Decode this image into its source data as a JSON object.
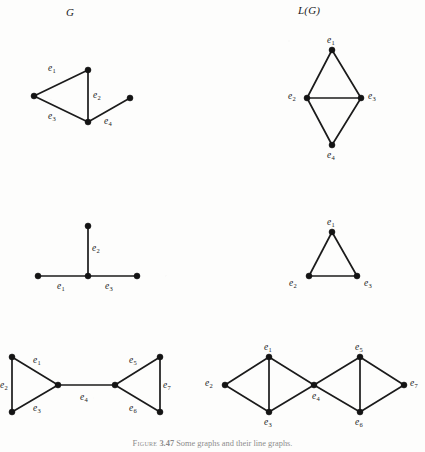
{
  "figure": {
    "caption_label": "Figure",
    "caption_number": "3.47",
    "caption_text": "Some graphs and their line graphs.",
    "columns": {
      "left_header": "G",
      "right_header": "L(G)"
    },
    "background_color": "#fdfdfc",
    "ink_color": "#1b1b1b"
  },
  "graphs": [
    {
      "id": "row1-left",
      "name": "graph-g-row1",
      "column": "G",
      "description": "Triangle with a pendant path; four labelled edges.",
      "nodes": [
        {
          "id": "a",
          "x": 88,
          "y": 70
        },
        {
          "id": "b",
          "x": 34,
          "y": 96
        },
        {
          "id": "c",
          "x": 88,
          "y": 122
        },
        {
          "id": "d",
          "x": 130,
          "y": 98
        }
      ],
      "edges": [
        {
          "from": "a",
          "to": "b",
          "label": "e",
          "sub": "1"
        },
        {
          "from": "a",
          "to": "c",
          "label": "e",
          "sub": "2"
        },
        {
          "from": "b",
          "to": "c",
          "label": "e",
          "sub": "3"
        },
        {
          "from": "c",
          "to": "d",
          "label": "e",
          "sub": "4"
        }
      ],
      "edge_labels": [
        {
          "label": "e",
          "sub": "1",
          "x": 48,
          "y": 64
        },
        {
          "label": "e",
          "sub": "2",
          "x": 93,
          "y": 91
        },
        {
          "label": "e",
          "sub": "3",
          "x": 48,
          "y": 112
        },
        {
          "label": "e",
          "sub": "4",
          "x": 104,
          "y": 117
        }
      ]
    },
    {
      "id": "row1-right",
      "name": "line-graph-lg-row1",
      "column": "L(G)",
      "description": "Diamond K4 minus an edge; vertices named for edges of G.",
      "nodes": [
        {
          "id": "e1",
          "x": 332,
          "y": 50
        },
        {
          "id": "e2",
          "x": 307,
          "y": 98
        },
        {
          "id": "e3",
          "x": 361,
          "y": 98
        },
        {
          "id": "e4",
          "x": 332,
          "y": 145
        }
      ],
      "edges": [
        {
          "from": "e1",
          "to": "e2"
        },
        {
          "from": "e1",
          "to": "e3"
        },
        {
          "from": "e2",
          "to": "e3"
        },
        {
          "from": "e2",
          "to": "e4"
        },
        {
          "from": "e3",
          "to": "e4"
        }
      ],
      "vertex_labels": [
        {
          "label": "e",
          "sub": "1",
          "x": 327,
          "y": 36
        },
        {
          "label": "e",
          "sub": "2",
          "x": 288,
          "y": 92
        },
        {
          "label": "e",
          "sub": "3",
          "x": 368,
          "y": 92
        },
        {
          "label": "e",
          "sub": "4",
          "x": 327,
          "y": 151
        }
      ]
    },
    {
      "id": "row2-left",
      "name": "graph-g-row2",
      "column": "G",
      "description": "Star K1,3 drawn as a T shape; three labelled edges.",
      "nodes": [
        {
          "id": "top",
          "x": 88,
          "y": 226
        },
        {
          "id": "center",
          "x": 88,
          "y": 276
        },
        {
          "id": "left",
          "x": 38,
          "y": 276
        },
        {
          "id": "right",
          "x": 137,
          "y": 276
        }
      ],
      "edges": [
        {
          "from": "center",
          "to": "left",
          "label": "e",
          "sub": "1"
        },
        {
          "from": "center",
          "to": "top",
          "label": "e",
          "sub": "2"
        },
        {
          "from": "center",
          "to": "right",
          "label": "e",
          "sub": "3"
        }
      ],
      "edge_labels": [
        {
          "label": "e",
          "sub": "1",
          "x": 57,
          "y": 282
        },
        {
          "label": "e",
          "sub": "2",
          "x": 92,
          "y": 244
        },
        {
          "label": "e",
          "sub": "3",
          "x": 105,
          "y": 282
        }
      ]
    },
    {
      "id": "row2-right",
      "name": "line-graph-lg-row2",
      "column": "L(G)",
      "description": "Triangle K3; vertices named for the three edges of the star.",
      "nodes": [
        {
          "id": "e1",
          "x": 332,
          "y": 232
        },
        {
          "id": "e2",
          "x": 309,
          "y": 276
        },
        {
          "id": "e3",
          "x": 357,
          "y": 276
        }
      ],
      "edges": [
        {
          "from": "e1",
          "to": "e2"
        },
        {
          "from": "e1",
          "to": "e3"
        },
        {
          "from": "e2",
          "to": "e3"
        }
      ],
      "vertex_labels": [
        {
          "label": "e",
          "sub": "1",
          "x": 327,
          "y": 218
        },
        {
          "label": "e",
          "sub": "2",
          "x": 289,
          "y": 279
        },
        {
          "label": "e",
          "sub": "3",
          "x": 364,
          "y": 279
        }
      ]
    },
    {
      "id": "row3-left",
      "name": "graph-g-row3",
      "column": "G",
      "description": "Bowtie: two triangles joined by a bridge; seven labelled edges.",
      "nodes": [
        {
          "id": "lt",
          "x": 12,
          "y": 357
        },
        {
          "id": "lb",
          "x": 12,
          "y": 412
        },
        {
          "id": "lc",
          "x": 58,
          "y": 385
        },
        {
          "id": "rc",
          "x": 115,
          "y": 385
        },
        {
          "id": "rt",
          "x": 160,
          "y": 357
        },
        {
          "id": "rb",
          "x": 160,
          "y": 412
        }
      ],
      "edges": [
        {
          "from": "lt",
          "to": "lc",
          "label": "e",
          "sub": "1"
        },
        {
          "from": "lt",
          "to": "lb",
          "label": "e",
          "sub": "2"
        },
        {
          "from": "lb",
          "to": "lc",
          "label": "e",
          "sub": "3"
        },
        {
          "from": "lc",
          "to": "rc",
          "label": "e",
          "sub": "4"
        },
        {
          "from": "rc",
          "to": "rt",
          "label": "e",
          "sub": "5"
        },
        {
          "from": "rc",
          "to": "rb",
          "label": "e",
          "sub": "6"
        },
        {
          "from": "rt",
          "to": "rb",
          "label": "e",
          "sub": "7"
        }
      ],
      "edge_labels": [
        {
          "label": "e",
          "sub": "1",
          "x": 33,
          "y": 356
        },
        {
          "label": "e",
          "sub": "2",
          "x": 0,
          "y": 381
        },
        {
          "label": "e",
          "sub": "3",
          "x": 33,
          "y": 404
        },
        {
          "label": "e",
          "sub": "4",
          "x": 80,
          "y": 393
        },
        {
          "label": "e",
          "sub": "5",
          "x": 129,
          "y": 356
        },
        {
          "label": "e",
          "sub": "6",
          "x": 129,
          "y": 404
        },
        {
          "label": "e",
          "sub": "7",
          "x": 163,
          "y": 381
        }
      ]
    },
    {
      "id": "row3-right",
      "name": "line-graph-lg-row3",
      "column": "L(G)",
      "description": "Line graph of the bowtie: two K4-minus-edge diamonds sharing vertex e4, plus e7.",
      "nodes": [
        {
          "id": "e2",
          "x": 225,
          "y": 385
        },
        {
          "id": "e1",
          "x": 269,
          "y": 357
        },
        {
          "id": "e3",
          "x": 269,
          "y": 412
        },
        {
          "id": "e4",
          "x": 314,
          "y": 385
        },
        {
          "id": "e5",
          "x": 360,
          "y": 357
        },
        {
          "id": "e6",
          "x": 360,
          "y": 412
        },
        {
          "id": "e7",
          "x": 404,
          "y": 385
        }
      ],
      "edges": [
        {
          "from": "e2",
          "to": "e1"
        },
        {
          "from": "e2",
          "to": "e3"
        },
        {
          "from": "e1",
          "to": "e3"
        },
        {
          "from": "e1",
          "to": "e4"
        },
        {
          "from": "e3",
          "to": "e4"
        },
        {
          "from": "e4",
          "to": "e5"
        },
        {
          "from": "e4",
          "to": "e6"
        },
        {
          "from": "e5",
          "to": "e6"
        },
        {
          "from": "e5",
          "to": "e7"
        },
        {
          "from": "e6",
          "to": "e7"
        }
      ],
      "vertex_labels": [
        {
          "label": "e",
          "sub": "2",
          "x": 205,
          "y": 379
        },
        {
          "label": "e",
          "sub": "1",
          "x": 264,
          "y": 343
        },
        {
          "label": "e",
          "sub": "3",
          "x": 264,
          "y": 418
        },
        {
          "label": "e",
          "sub": "4",
          "x": 312,
          "y": 392
        },
        {
          "label": "e",
          "sub": "5",
          "x": 355,
          "y": 343
        },
        {
          "label": "e",
          "sub": "6",
          "x": 355,
          "y": 418
        },
        {
          "label": "e",
          "sub": "7",
          "x": 410,
          "y": 379
        }
      ]
    }
  ]
}
